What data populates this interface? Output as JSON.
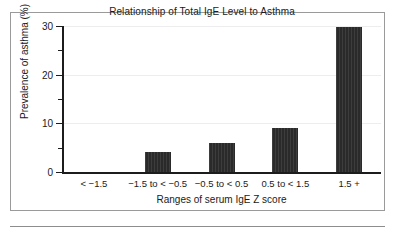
{
  "chart_data": {
    "type": "bar",
    "title": "Relationship of Total IgE Level to Asthma",
    "xlabel": "Ranges of serum IgE Z score",
    "ylabel": "Prevalence of asthma (%)",
    "categories": [
      "< −1.5",
      "−1.5 to < −0.5",
      "−0.5 to < 0.5",
      "0.5 to < 1.5",
      "1.5 +"
    ],
    "values": [
      0,
      4.2,
      5.9,
      9.0,
      29.7
    ],
    "ylim": [
      0,
      30
    ],
    "y_ticks": [
      0,
      10,
      20,
      30
    ],
    "y_tick_labels": [
      "0",
      "10",
      "20",
      "30"
    ],
    "y_minor_ticks": [
      5,
      15,
      25
    ],
    "grid": "horizontal-light",
    "legend": "none",
    "bar_color": "#2a2a2a",
    "axis_color": "#1c1c1c",
    "gridline_color": "#ededed",
    "background": "#ffffff"
  }
}
